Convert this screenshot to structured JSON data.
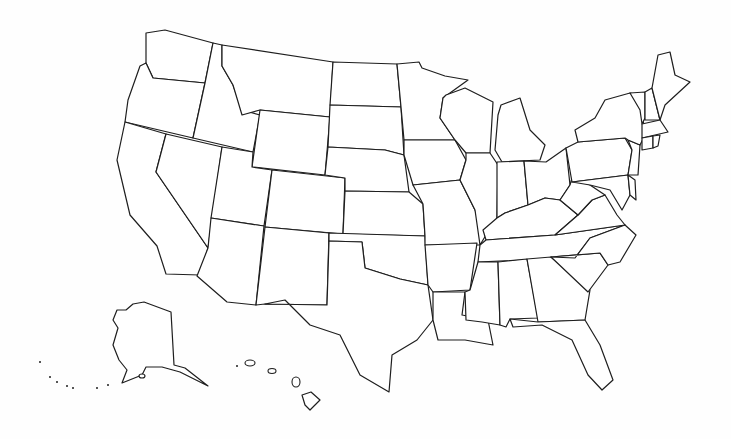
{
  "map": {
    "title": "United States blank outline map",
    "background": "#fefefe",
    "stroke_color": "#1e1e1e",
    "fill_color": "#ffffff",
    "labels_shown": false,
    "states": [
      {
        "id": "WA",
        "name": "Washington",
        "points": "146,33 165,30 213,43 205,83 153,78 146,63"
      },
      {
        "id": "OR",
        "name": "Oregon",
        "points": "146,63 153,78 205,83 193,138 125,122 128,100 140,66"
      },
      {
        "id": "CA",
        "name": "California",
        "points": "125,122 166,134 156,172 208,248 200,275 166,274 157,246 130,215 117,160"
      },
      {
        "id": "NV",
        "name": "Nevada",
        "points": "166,134 222,147 208,248 156,172"
      },
      {
        "id": "ID",
        "name": "Idaho",
        "points": "213,43 222,45 222,66 233,85 242,110 260,115 253,152 193,138 205,83"
      },
      {
        "id": "MT",
        "name": "Montana",
        "points": "222,45 333,62 330,117 260,110 242,115 233,85 222,66"
      },
      {
        "id": "WY",
        "name": "Wyoming",
        "points": "260,110 330,117 325,175 252,167"
      },
      {
        "id": "UT",
        "name": "Utah",
        "points": "222,147 253,152 252,167 272,170 264,226 211,218"
      },
      {
        "id": "CO",
        "name": "Colorado",
        "points": "272,170 345,178 343,234 265,227"
      },
      {
        "id": "AZ",
        "name": "Arizona",
        "points": "211,218 264,226 256,305 227,302 197,276 208,248"
      },
      {
        "id": "NM",
        "name": "New Mexico",
        "points": "265,227 329,233 327,305 265,304 256,305"
      },
      {
        "id": "ND",
        "name": "North Dakota",
        "points": "333,62 397,64 401,107 330,105"
      },
      {
        "id": "SD",
        "name": "South Dakota",
        "points": "330,105 401,107 404,155 385,150 328,147"
      },
      {
        "id": "NE",
        "name": "Nebraska",
        "points": "328,147 385,150 404,155 409,192 345,191 345,178 325,175"
      },
      {
        "id": "KS",
        "name": "Kansas",
        "points": "345,191 409,192 423,204 425,236 343,234"
      },
      {
        "id": "OK",
        "name": "Oklahoma",
        "points": "329,233 425,236 428,285 400,279 365,268 362,242 329,241"
      },
      {
        "id": "TX",
        "name": "Texas",
        "points": "329,241 362,242 365,268 400,279 428,285 433,320 417,340 392,355 389,392 360,375 340,335 310,325 285,300 265,304 327,305"
      },
      {
        "id": "MN",
        "name": "Minnesota",
        "points": "397,64 419,62 422,68 445,76 468,80 443,98 440,118 455,140 404,140 401,107"
      },
      {
        "id": "IA",
        "name": "Iowa",
        "points": "404,140 455,140 466,160 460,180 413,185 404,155"
      },
      {
        "id": "MO",
        "name": "Missouri",
        "points": "413,185 460,180 475,210 483,230 480,245 425,245 425,236 423,204"
      },
      {
        "id": "AR",
        "name": "Arkansas",
        "points": "425,245 477,243 470,290 433,292 428,285"
      },
      {
        "id": "LA",
        "name": "Louisiana",
        "points": "433,292 465,292 462,315 488,320 493,345 465,340 438,340 433,320"
      },
      {
        "id": "WI",
        "name": "Wisconsin",
        "points": "446,95 465,88 493,102 490,153 466,153 455,140 440,118 443,98"
      },
      {
        "id": "IL",
        "name": "Illinois",
        "points": "466,153 490,153 498,165 497,218 486,235 480,245 475,210 460,180 466,160"
      },
      {
        "id": "MI",
        "name": "Michigan",
        "points": "501,105 520,98 530,130 545,145 540,160 502,162 495,150 498,115"
      },
      {
        "id": "IN",
        "name": "Indiana",
        "points": "497,162 524,161 528,205 505,213 497,218"
      },
      {
        "id": "OH",
        "name": "Ohio",
        "points": "524,161 546,162 566,148 570,185 560,200 545,198 528,205"
      },
      {
        "id": "KY",
        "name": "Kentucky",
        "points": "483,230 497,218 505,213 528,205 545,198 560,200 578,215 555,235 486,240"
      },
      {
        "id": "TN",
        "name": "Tennessee",
        "points": "480,245 486,240 555,235 625,225 590,238 575,258 478,262"
      },
      {
        "id": "MS",
        "name": "Mississippi",
        "points": "478,262 498,262 500,325 482,322 466,320 465,292 470,290"
      },
      {
        "id": "AL",
        "name": "Alabama",
        "points": "498,262 527,259 538,318 510,319 506,327 500,325"
      },
      {
        "id": "GA",
        "name": "Georgia",
        "points": "527,259 551,257 590,290 585,320 538,322"
      },
      {
        "id": "FL",
        "name": "Florida",
        "points": "510,319 538,322 585,320 600,345 613,380 602,390 588,375 572,340 542,325 513,327"
      },
      {
        "id": "SC",
        "name": "South Carolina",
        "points": "551,257 600,253 608,265 588,292"
      },
      {
        "id": "NC",
        "name": "North Carolina",
        "points": "575,258 590,238 625,225 636,235 620,262 608,265 600,253 551,257"
      },
      {
        "id": "VA",
        "name": "Virginia",
        "points": "555,235 578,215 592,200 605,195 617,215 625,225"
      },
      {
        "id": "WV",
        "name": "West Virginia",
        "points": "560,200 570,185 572,178 590,185 605,195 592,200 578,215"
      },
      {
        "id": "PA",
        "name": "Pennsylvania",
        "points": "566,148 578,142 625,138 632,150 628,175 572,182"
      },
      {
        "id": "MD",
        "name": "Maryland",
        "points": "572,182 628,175 630,195 622,210 610,190 590,185"
      },
      {
        "id": "DE",
        "name": "Delaware",
        "points": "628,175 635,180 636,200 630,195"
      },
      {
        "id": "NJ",
        "name": "New Jersey",
        "points": "628,140 640,145 638,175 628,175 632,150"
      },
      {
        "id": "NY",
        "name": "New York",
        "points": "578,142 575,130 595,118 605,100 630,93 640,95 645,135 640,145 628,140 625,138"
      },
      {
        "id": "VT",
        "name": "Vermont",
        "points": "630,93 645,92 645,118 642,124 640,110"
      },
      {
        "id": "NH",
        "name": "New Hampshire",
        "points": "645,92 652,88 660,120 645,120"
      },
      {
        "id": "ME",
        "name": "Maine",
        "points": "652,88 658,55 670,52 675,75 690,82 665,105 660,120"
      },
      {
        "id": "MA",
        "name": "Massachusetts",
        "points": "642,124 660,120 668,132 655,135 642,138"
      },
      {
        "id": "CT",
        "name": "Connecticut",
        "points": "642,138 653,136 653,148 642,150"
      },
      {
        "id": "RI",
        "name": "Rhode Island",
        "points": "653,136 660,135 658,146 653,148"
      },
      {
        "id": "AK",
        "name": "Alaska",
        "points": "133,304 144,302 171,312 174,365 185,368 208,386 200,382 180,372 162,367 146,367 142,375 122,383 127,370 119,360 113,345 118,328 113,320 117,310 126,310"
      },
      {
        "id": "HI",
        "name": "Hawaii",
        "points": "302,395 311,392 320,400 310,410 305,405"
      }
    ],
    "islands": [
      {
        "name": "hi-kauai",
        "cx": 250,
        "cy": 363,
        "rx": 5,
        "ry": 3
      },
      {
        "name": "hi-oahu",
        "cx": 272,
        "cy": 371,
        "rx": 4,
        "ry": 2.5
      },
      {
        "name": "hi-maui",
        "cx": 296,
        "cy": 382,
        "rx": 4,
        "ry": 5
      },
      {
        "name": "ak-kodiak",
        "cx": 142,
        "cy": 376,
        "rx": 3,
        "ry": 2
      }
    ],
    "dots": [
      {
        "name": "aleutian-1",
        "cx": 40,
        "cy": 362
      },
      {
        "name": "aleutian-2",
        "cx": 50,
        "cy": 377
      },
      {
        "name": "aleutian-3",
        "cx": 57,
        "cy": 382
      },
      {
        "name": "aleutian-4",
        "cx": 67,
        "cy": 386
      },
      {
        "name": "aleutian-5",
        "cx": 73,
        "cy": 388
      },
      {
        "name": "aleutian-6",
        "cx": 97,
        "cy": 388
      },
      {
        "name": "aleutian-7",
        "cx": 108,
        "cy": 385
      },
      {
        "name": "hi-niihau",
        "cx": 237,
        "cy": 366
      }
    ]
  }
}
